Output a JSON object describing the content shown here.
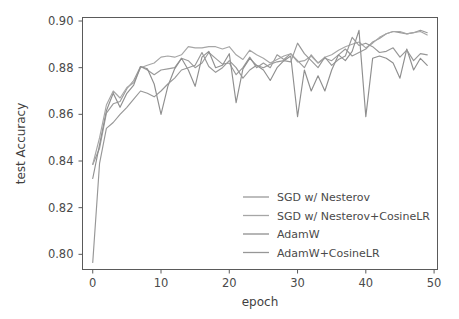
{
  "chart_data": {
    "type": "line",
    "title": "",
    "xlabel": "epoch",
    "ylabel": "test Accuracy",
    "xlim": [
      -1.5,
      50.5
    ],
    "ylim": [
      0.7935,
      0.9015
    ],
    "xticks": [
      0,
      10,
      20,
      30,
      40,
      50
    ],
    "xtick_labels": [
      "0",
      "10",
      "20",
      "30",
      "40",
      "50"
    ],
    "yticks": [
      0.8,
      0.82,
      0.84,
      0.86,
      0.88,
      0.9
    ],
    "ytick_labels": [
      "0.80",
      "0.82",
      "0.84",
      "0.86",
      "0.88",
      "0.90"
    ],
    "grid": false,
    "legend_position": "lower right",
    "x": [
      0,
      1,
      2,
      3,
      4,
      5,
      6,
      7,
      8,
      9,
      10,
      11,
      12,
      13,
      14,
      15,
      16,
      17,
      18,
      19,
      20,
      21,
      22,
      23,
      24,
      25,
      26,
      27,
      28,
      29,
      30,
      31,
      32,
      33,
      34,
      35,
      36,
      37,
      38,
      39,
      40,
      41,
      42,
      43,
      44,
      45,
      46,
      47,
      48,
      49
    ],
    "series": [
      {
        "name": "SGD w/ Nesterov",
        "color": "#9a9a9a",
        "values": [
          0.8385,
          0.8455,
          0.8605,
          0.8645,
          0.8655,
          0.871,
          0.8745,
          0.8805,
          0.879,
          0.877,
          0.879,
          0.8795,
          0.88,
          0.884,
          0.883,
          0.88,
          0.882,
          0.8865,
          0.884,
          0.8815,
          0.882,
          0.877,
          0.88,
          0.8845,
          0.88,
          0.882,
          0.88,
          0.8855,
          0.8835,
          0.886,
          0.883,
          0.88,
          0.8855,
          0.882,
          0.884,
          0.883,
          0.8855,
          0.888,
          0.885,
          0.8865,
          0.888,
          0.891,
          0.8925,
          0.8945,
          0.8955,
          0.895,
          0.8945,
          0.895,
          0.896,
          0.895
        ]
      },
      {
        "name": "SGD w/ Nesterov+CosineLR",
        "color": "#a6a6a6",
        "values": [
          0.8385,
          0.85,
          0.864,
          0.87,
          0.867,
          0.8715,
          0.8735,
          0.88,
          0.881,
          0.882,
          0.8845,
          0.885,
          0.8845,
          0.8855,
          0.889,
          0.8885,
          0.8885,
          0.889,
          0.889,
          0.888,
          0.889,
          0.8855,
          0.8835,
          0.8875,
          0.8855,
          0.884,
          0.882,
          0.8835,
          0.885,
          0.886,
          0.8825,
          0.883,
          0.885,
          0.882,
          0.8845,
          0.8855,
          0.8875,
          0.889,
          0.89,
          0.891,
          0.8885,
          0.8905,
          0.893,
          0.8945,
          0.8955,
          0.8955,
          0.8945,
          0.895,
          0.8955,
          0.894
        ]
      },
      {
        "name": "AdamW",
        "color": "#8f8f8f",
        "values": [
          0.8325,
          0.847,
          0.8615,
          0.869,
          0.863,
          0.869,
          0.8725,
          0.8805,
          0.8795,
          0.873,
          0.86,
          0.872,
          0.8795,
          0.884,
          0.879,
          0.872,
          0.8845,
          0.887,
          0.88,
          0.881,
          0.886,
          0.865,
          0.8795,
          0.884,
          0.881,
          0.879,
          0.8745,
          0.88,
          0.883,
          0.885,
          0.859,
          0.879,
          0.87,
          0.8765,
          0.87,
          0.879,
          0.8855,
          0.883,
          0.887,
          0.896,
          0.859,
          0.884,
          0.885,
          0.884,
          0.882,
          0.8755,
          0.888,
          0.879,
          0.884,
          0.881
        ]
      },
      {
        "name": "AdamW+CosineLR",
        "color": "#979797",
        "values": [
          0.7965,
          0.839,
          0.854,
          0.8565,
          0.86,
          0.863,
          0.8665,
          0.87,
          0.869,
          0.8675,
          0.87,
          0.873,
          0.8755,
          0.879,
          0.88,
          0.881,
          0.8865,
          0.8805,
          0.878,
          0.88,
          0.883,
          0.88,
          0.8755,
          0.879,
          0.881,
          0.88,
          0.8815,
          0.8825,
          0.883,
          0.8825,
          0.8905,
          0.886,
          0.883,
          0.88,
          0.8845,
          0.881,
          0.8835,
          0.885,
          0.893,
          0.8895,
          0.8905,
          0.889,
          0.8865,
          0.887,
          0.8885,
          0.8845,
          0.8875,
          0.883,
          0.886,
          0.8855
        ]
      }
    ]
  }
}
